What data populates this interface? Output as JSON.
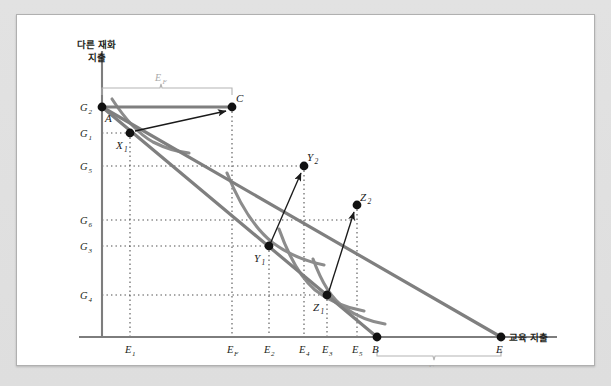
{
  "figure": {
    "axes": {
      "y_title_line1": "다른 재화",
      "y_title_line2": "지출",
      "x_title": "교육 지출"
    },
    "y_ticks": [
      {
        "id": "G2",
        "base": "G",
        "sub": "2",
        "y": 92
      },
      {
        "id": "G1",
        "base": "G",
        "sub": "1",
        "y": 118
      },
      {
        "id": "G5",
        "base": "G",
        "sub": "5",
        "y": 151
      },
      {
        "id": "G6",
        "base": "G",
        "sub": "6",
        "y": 205
      },
      {
        "id": "G3",
        "base": "G",
        "sub": "3",
        "y": 231
      },
      {
        "id": "G4",
        "base": "G",
        "sub": "4",
        "y": 280
      }
    ],
    "x_ticks": [
      {
        "id": "E1",
        "base": "E",
        "sub": "1",
        "x": 113
      },
      {
        "id": "EF",
        "base": "E",
        "sub": "F",
        "x": 215
      },
      {
        "id": "E2",
        "base": "E",
        "sub": "2",
        "x": 252
      },
      {
        "id": "E4",
        "base": "E",
        "sub": "4",
        "x": 287
      },
      {
        "id": "E3",
        "base": "E",
        "sub": "3",
        "x": 310
      },
      {
        "id": "E5",
        "base": "E",
        "sub": "5",
        "x": 340
      }
    ],
    "x_points": [
      {
        "id": "B",
        "base": "B",
        "sub": "",
        "x": 360
      },
      {
        "id": "E",
        "base": "E",
        "sub": "",
        "x": 484
      }
    ],
    "points": [
      {
        "id": "A",
        "base": "A",
        "sub": "",
        "x": 85,
        "y": 92,
        "lx": 89,
        "ly": 106,
        "dot": true
      },
      {
        "id": "C",
        "base": "C",
        "sub": "",
        "x": 215,
        "y": 92,
        "lx": 220,
        "ly": 85,
        "dot": true
      },
      {
        "id": "X1",
        "base": "X",
        "sub": "1",
        "x": 113,
        "y": 118,
        "lx": 99,
        "ly": 133,
        "dot": true
      },
      {
        "id": "Y2",
        "base": "Y",
        "sub": "2",
        "x": 287,
        "y": 151,
        "lx": 292,
        "ly": 145,
        "dot": true
      },
      {
        "id": "Z2",
        "base": "Z",
        "sub": "2",
        "x": 340,
        "y": 190,
        "lx": 345,
        "ly": 185,
        "dot": true
      },
      {
        "id": "Y1",
        "base": "Y",
        "sub": "1",
        "x": 252,
        "y": 231,
        "lx": 238,
        "ly": 246,
        "dot": true
      },
      {
        "id": "Z1",
        "base": "Z",
        "sub": "1",
        "x": 310,
        "y": 280,
        "lx": 297,
        "ly": 295,
        "dot": true
      },
      {
        "id": "B",
        "base": "B",
        "sub": "",
        "x": 360,
        "y": 322,
        "lx": 356,
        "ly": 337,
        "dot": true
      },
      {
        "id": "E",
        "base": "E",
        "sub": "",
        "x": 484,
        "y": 322,
        "lx": 480,
        "ly": 337,
        "dot": true
      },
      {
        "id": "G2",
        "base": "",
        "sub": "",
        "x": 85,
        "y": 92,
        "lx": 0,
        "ly": 0,
        "dot": true
      }
    ],
    "brackets": [
      {
        "id": "top-bracket",
        "label_base": "E",
        "label_sub": "F",
        "x1": 85,
        "x2": 215,
        "y": 73,
        "label_x": 144,
        "label_y": 66
      },
      {
        "id": "bottom-bracket",
        "label_base": "E",
        "label_sub": "F",
        "x1": 360,
        "x2": 484,
        "y": 341,
        "label_x": 417,
        "label_y": 357
      }
    ],
    "budget_lines": [
      {
        "id": "budget-line-outer",
        "x1": 85,
        "y1": 92,
        "x2": 484,
        "y2": 322
      },
      {
        "id": "budget-line-inner",
        "x1": 85,
        "y1": 92,
        "x2": 360,
        "y2": 322
      },
      {
        "id": "budget-line-horizontal",
        "x1": 85,
        "y1": 92,
        "x2": 215,
        "y2": 92
      }
    ],
    "arrows": [
      {
        "id": "arrow-x1-to-c",
        "x1": 118,
        "y1": 116,
        "x2": 210,
        "y2": 96
      },
      {
        "id": "arrow-y1-to-y2",
        "x1": 254,
        "y1": 227,
        "x2": 284,
        "y2": 157
      },
      {
        "id": "arrow-z1-to-z2",
        "x1": 312,
        "y1": 276,
        "x2": 337,
        "y2": 196
      }
    ],
    "colors": {
      "budget_line": "#7f7f7f",
      "indifference_curve": "#8c8c8c",
      "axis": "#7d7d7d",
      "dot": "#111111",
      "arrow": "#1a1a1a",
      "grid_dot": "#4d4d4d",
      "bracket": "#b3b3b3",
      "panel_bg": "#ffffff",
      "page_bg": "#dedede"
    }
  }
}
